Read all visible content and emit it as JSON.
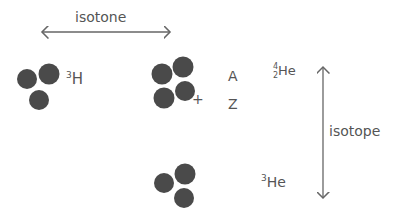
{
  "labels": {
    "isotone": "isotone",
    "isotope": "isotope",
    "A": "A",
    "Z": "Z",
    "plus": "+",
    "h3": {
      "mass": "3",
      "symbol": "H"
    },
    "he4": {
      "mass": "4",
      "atomic": "2",
      "symbol": "He"
    },
    "he3": {
      "mass": "3",
      "symbol": "He"
    }
  },
  "colors": {
    "particle": "#4a4a4a",
    "ink": "#555555"
  }
}
